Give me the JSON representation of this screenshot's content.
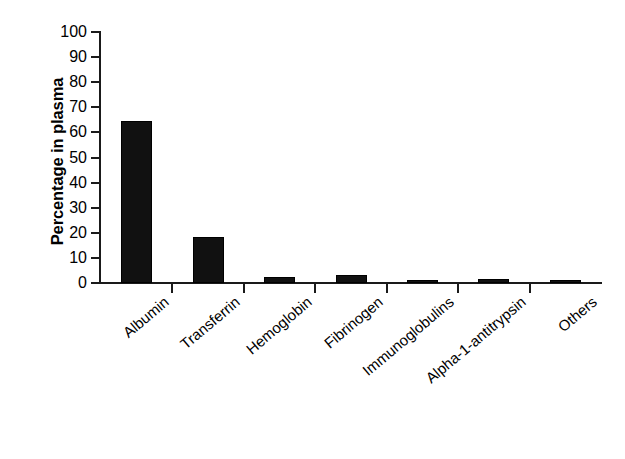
{
  "chart_data": {
    "type": "bar",
    "title": "",
    "subtitle": "",
    "xlabel": "",
    "ylabel": "Percentage in plasma",
    "ylim": [
      0,
      100
    ],
    "yticks": [
      0,
      10,
      20,
      30,
      40,
      50,
      60,
      70,
      80,
      90,
      100
    ],
    "ytick_labels": [
      "0",
      "10",
      "20",
      "30",
      "40",
      "50",
      "60",
      "70",
      "80",
      "90",
      "100"
    ],
    "grid": false,
    "legend": null,
    "bar_color": "#111111",
    "background_color": "#ffffff",
    "axis_color": "#1a1a1a",
    "categories": [
      "Albumin",
      "Transferrin",
      "Hemoglobin",
      "Fibrinogen",
      "Immunoglobulins",
      "Alpha-1-antitrypsin",
      "Others"
    ],
    "values": [
      64.5,
      18.3,
      2.4,
      3.2,
      1.0,
      1.6,
      1.0
    ],
    "annotations": []
  }
}
